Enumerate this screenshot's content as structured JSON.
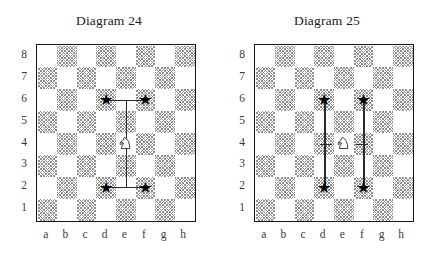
{
  "page": {
    "background": "#ffffff",
    "width": 436,
    "height": 255
  },
  "style": {
    "dark_square_color": "#8e8e8e",
    "light_square_color": "#ffffff",
    "border_color": "#16161a",
    "marker_color": "#000000",
    "line_color": "#2a2a2a",
    "label_color": "#3a3a3a"
  },
  "files": [
    "a",
    "b",
    "c",
    "d",
    "e",
    "f",
    "g",
    "h"
  ],
  "ranks": [
    "8",
    "7",
    "6",
    "5",
    "4",
    "3",
    "2",
    "1"
  ],
  "diagrams": [
    {
      "id": "diagram-24",
      "title": "Diagram 24",
      "pieces": [
        {
          "type": "knight",
          "color": "white",
          "square": "e4",
          "icon": "knight-icon"
        }
      ],
      "markers": [
        {
          "type": "star",
          "square": "d6",
          "icon": "star-icon"
        },
        {
          "type": "star",
          "square": "f6",
          "icon": "star-icon"
        },
        {
          "type": "star",
          "square": "d2",
          "icon": "star-icon"
        },
        {
          "type": "star",
          "square": "f2",
          "icon": "star-icon"
        }
      ],
      "lines": [
        {
          "orientation": "vertical",
          "file": "e",
          "from_rank": 6,
          "to_rank": 2
        },
        {
          "orientation": "horizontal",
          "rank": 6,
          "from_file": "d",
          "to_file": "f"
        },
        {
          "orientation": "horizontal",
          "rank": 2,
          "from_file": "d",
          "to_file": "f"
        }
      ]
    },
    {
      "id": "diagram-25",
      "title": "Diagram 25",
      "pieces": [
        {
          "type": "knight",
          "color": "white",
          "square": "e4",
          "icon": "knight-icon"
        }
      ],
      "markers": [
        {
          "type": "star",
          "square": "d6",
          "icon": "star-icon"
        },
        {
          "type": "star",
          "square": "f6",
          "icon": "star-icon"
        },
        {
          "type": "star",
          "square": "d2",
          "icon": "star-icon"
        },
        {
          "type": "star",
          "square": "f2",
          "icon": "star-icon"
        }
      ],
      "lines": [
        {
          "orientation": "vertical",
          "file": "d",
          "from_rank": 6,
          "to_rank": 2
        },
        {
          "orientation": "vertical",
          "file": "f",
          "from_rank": 6,
          "to_rank": 2
        },
        {
          "orientation": "horizontal",
          "rank": 4,
          "from_file": "d",
          "to_file": "e",
          "tick": true
        },
        {
          "orientation": "horizontal",
          "rank": 4,
          "from_file": "e",
          "to_file": "f",
          "tick": true
        }
      ]
    }
  ],
  "glyphs": {
    "star": "★"
  }
}
